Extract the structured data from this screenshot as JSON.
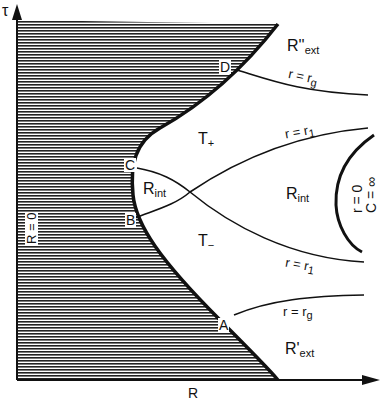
{
  "axes": {
    "y_label": "τ",
    "x_label": "R",
    "left_boundary_label": "R = 0"
  },
  "points": {
    "A": "A",
    "B": "B",
    "C": "C",
    "D": "D"
  },
  "regions": {
    "r_ext_upper": {
      "main": "R''",
      "sub": "ext"
    },
    "r_ext_lower": {
      "main": "R'",
      "sub": "ext"
    },
    "t_plus": {
      "main": "T",
      "sub": "+"
    },
    "t_minus": {
      "main": "T",
      "sub": "−"
    },
    "r_int_left": {
      "main": "R",
      "sub": "int"
    },
    "r_int_right": {
      "main": "R",
      "sub": "int"
    }
  },
  "curves": {
    "rg_upper": {
      "main": "r = r",
      "sub": "g"
    },
    "r1_upper": {
      "main": "r = r",
      "sub": "1"
    },
    "r1_lower": {
      "main": "r = r",
      "sub": "1"
    },
    "rg_lower": {
      "main": "r = r",
      "sub": "g"
    },
    "singularity_r": "r = 0",
    "singularity_c": "C = ∞"
  },
  "colors": {
    "ink": "#111111",
    "background": "#ffffff"
  }
}
